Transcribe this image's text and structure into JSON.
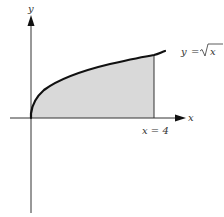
{
  "diagram": {
    "axes": {
      "x_label": "x",
      "y_label": "y"
    },
    "curve": {
      "label_lhs": "y",
      "label_eq": "=",
      "label_rhs": "x",
      "function": "sqrt(x)"
    },
    "boundary": {
      "label": "x = 4",
      "x_value": 4
    },
    "colors": {
      "shade": "#d9d9d9",
      "curve": "#111111",
      "axis": "#333333"
    }
  }
}
